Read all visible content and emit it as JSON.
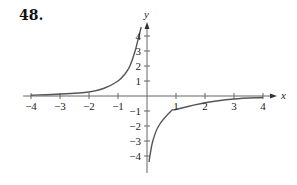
{
  "problem_number": "48.",
  "chart_data": {
    "type": "line",
    "title": "",
    "xlabel": "x",
    "ylabel": "y",
    "xlim": [
      -4.2,
      4.3
    ],
    "ylim": [
      -4.5,
      4.8
    ],
    "grid": false,
    "legend": null,
    "x_ticks": [
      -4,
      -3,
      -2,
      -1,
      1,
      2,
      3,
      4
    ],
    "x_tick_labels": [
      "−4",
      "−3",
      "−2",
      "−1",
      "1",
      "2",
      "3",
      "4"
    ],
    "y_ticks": [
      -4,
      -3,
      -2,
      -1,
      1,
      2,
      3,
      4
    ],
    "y_tick_labels": [
      "−4",
      "−3",
      "−2",
      "−1",
      "1",
      "2",
      "3",
      "4"
    ],
    "asymptotes": {
      "vertical": 0,
      "horizontal": 0
    },
    "series": [
      {
        "name": "left branch (x < 0)",
        "x": [
          -4.0,
          -3.0,
          -2.0,
          -1.5,
          -1.0,
          -0.75,
          -0.59,
          -0.41,
          -0.28,
          -0.2
        ],
        "y": [
          0.05,
          0.13,
          0.27,
          0.5,
          1.0,
          1.5,
          2.0,
          3.0,
          4.0,
          4.6
        ]
      },
      {
        "name": "right branch (x > 0)",
        "x": [
          0.07,
          0.1,
          0.2,
          0.4,
          0.83,
          1.0,
          2.0,
          3.0,
          4.0
        ],
        "y": [
          -4.4,
          -4.0,
          -3.0,
          -2.0,
          -1.0,
          -0.9,
          -0.45,
          -0.2,
          -0.1
        ]
      }
    ],
    "color": "#555555"
  }
}
